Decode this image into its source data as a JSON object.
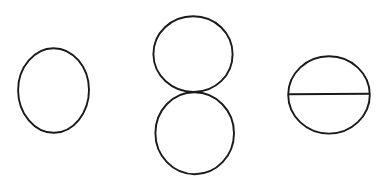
{
  "canvas": {
    "width": 388,
    "height": 189,
    "background_color": "#ffffff",
    "stroke_color": "#1a1a1a",
    "stroke_width": 1.9,
    "title": "Geometric Figures"
  },
  "figures": [
    {
      "id": "figure-1",
      "name": "single-circle",
      "label": "Circle",
      "shape": "circle",
      "center_x": 53.5,
      "center_y": 90.5,
      "radius_x": 35.5,
      "radius_y": 42.5,
      "rotation": -6,
      "parts": [
        {
          "name": "outline",
          "type": "ellipse"
        }
      ]
    },
    {
      "id": "figure-2",
      "name": "tangent-circles-figure-eight",
      "label": "Two Tangent Circles",
      "shape": "figure-eight",
      "tangent_point_x": 194,
      "tangent_point_y": 92,
      "parts": [
        {
          "name": "upper-circle",
          "type": "ellipse",
          "center_x": 193,
          "center_y": 54,
          "radius_x": 39.5,
          "radius_y": 38
        },
        {
          "name": "lower-circle",
          "type": "ellipse",
          "center_x": 195,
          "center_y": 133,
          "radius_x": 39,
          "radius_y": 41
        }
      ]
    },
    {
      "id": "figure-3",
      "name": "circle-with-diameter",
      "label": "Circle with Horizontal Diameter",
      "shape": "circle-with-chord",
      "center_x": 329,
      "center_y": 95,
      "radius_x": 41,
      "radius_y": 39,
      "chord_y": 94,
      "chord_x_start": 288,
      "chord_x_end": 370,
      "parts": [
        {
          "name": "outline",
          "type": "ellipse"
        },
        {
          "name": "diameter-line",
          "type": "line"
        }
      ]
    }
  ]
}
